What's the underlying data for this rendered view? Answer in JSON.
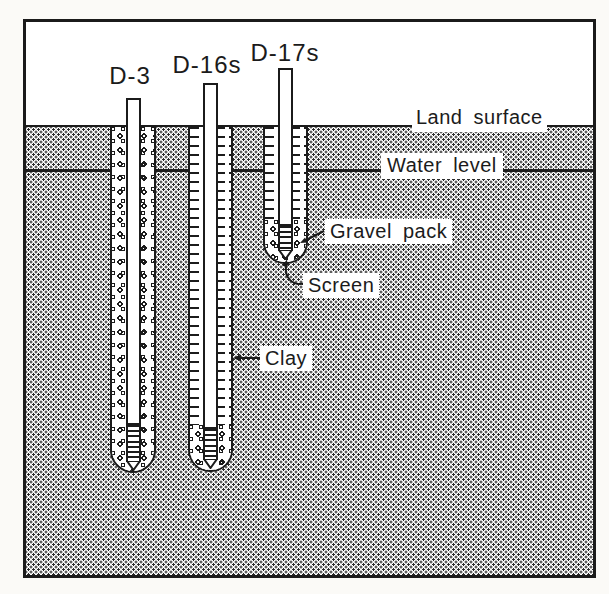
{
  "diagram": {
    "type": "hydrogeologic-cross-section",
    "wells": [
      {
        "id": "D-3",
        "label": "D-3",
        "annulus": "gravel full depth, screen at bottom"
      },
      {
        "id": "D-16s",
        "label": "D-16s",
        "annulus": "clay seal over gravel pack, screen at bottom"
      },
      {
        "id": "D-17s",
        "label": "D-17s",
        "annulus": "clay seal over gravel pack, shallow screen"
      }
    ],
    "annotations": {
      "land_surface": "Land surface",
      "water_level": "Water level",
      "gravel_pack": "Gravel pack",
      "screen": "Screen",
      "clay": "Clay"
    },
    "colors": {
      "ink": "#1b1b1b",
      "paper": "#fbfaf7",
      "fill": "#ffffff"
    }
  }
}
